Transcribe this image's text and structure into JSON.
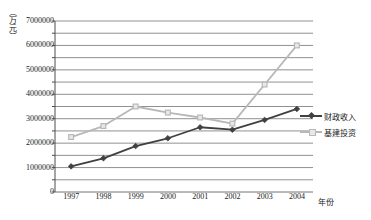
{
  "chart_data": {
    "type": "line",
    "title": "",
    "xlabel": "年份",
    "ylabel": "（万元）",
    "x": [
      "1997",
      "1998",
      "1999",
      "2000",
      "2001",
      "2002",
      "2003",
      "2004"
    ],
    "categories": [
      "1997",
      "1998",
      "1999",
      "2000",
      "2001",
      "2002",
      "2003",
      "2004"
    ],
    "ylim": [
      0,
      7000000
    ],
    "ytick_labels": [
      "0",
      "1000000",
      "2000000",
      "3000000",
      "4000000",
      "5000000",
      "6000000",
      "7000000"
    ],
    "ytick_values": [
      0,
      1000000,
      2000000,
      3000000,
      4000000,
      5000000,
      6000000,
      7000000
    ],
    "gridline_interval": 500000,
    "grid": true,
    "legend_position": "right",
    "series": [
      {
        "name": "财政收入",
        "color": "#404040",
        "marker": "diamond",
        "values": [
          1050000,
          1380000,
          1880000,
          2200000,
          2650000,
          2550000,
          2950000,
          3400000
        ]
      },
      {
        "name": "基建投资",
        "color": "#b8b8b8",
        "marker": "square",
        "values": [
          2250000,
          2700000,
          3500000,
          3250000,
          3050000,
          2800000,
          4400000,
          6000000
        ]
      }
    ]
  },
  "legend": {
    "items": [
      {
        "label": "财政收入"
      },
      {
        "label": "基建投资"
      }
    ]
  },
  "axes": {
    "y_title": "（万元）",
    "x_title": "年份"
  }
}
